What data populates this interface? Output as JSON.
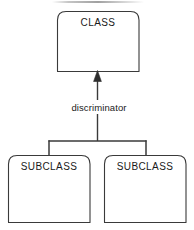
{
  "diagram": {
    "type": "uml-generalization",
    "colors": {
      "stroke": "#3a3a3a",
      "fill": "#ffffff",
      "text": "#1a1a1a",
      "background": "#ffffff"
    },
    "nodes": [
      {
        "id": "class",
        "label": "CLASS",
        "role": "superclass",
        "shape": "rounded-top-rectangle",
        "x": 57,
        "y": 11,
        "width": 82,
        "height": 61
      },
      {
        "id": "subclass-left",
        "label": "SUBCLASS",
        "role": "subclass",
        "shape": "rounded-top-rectangle",
        "x": 8,
        "y": 155,
        "width": 82,
        "height": 67
      },
      {
        "id": "subclass-right",
        "label": "SUBCLASS",
        "role": "subclass",
        "shape": "rounded-top-rectangle",
        "x": 104,
        "y": 155,
        "width": 82,
        "height": 67
      }
    ],
    "edges": [
      {
        "id": "generalization",
        "from": "fork",
        "to": "class",
        "label": "discriminator",
        "arrowhead": "solid-triangle",
        "arrow_at": "class",
        "style": "solid"
      },
      {
        "id": "fork-to-subclass-left",
        "from": "fork",
        "to": "subclass-left",
        "label": "",
        "arrowhead": "none",
        "style": "solid"
      },
      {
        "id": "fork-to-subclass-right",
        "from": "fork",
        "to": "subclass-right",
        "label": "",
        "arrowhead": "none",
        "style": "solid"
      }
    ]
  }
}
